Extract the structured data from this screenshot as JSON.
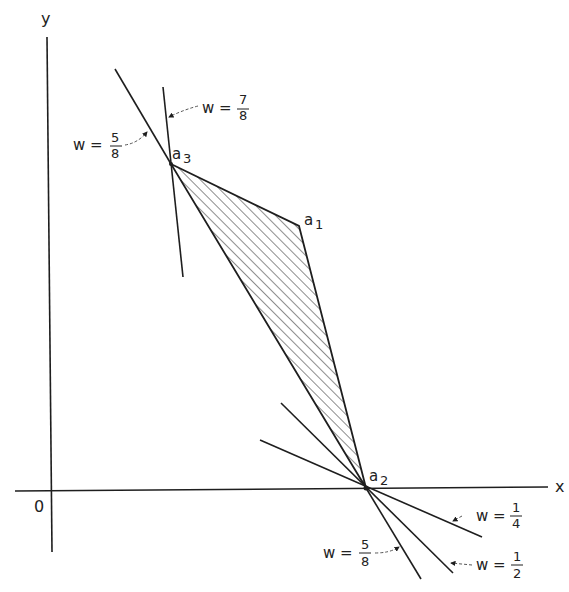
{
  "axes": {
    "x_label": "x",
    "y_label": "y",
    "origin_label": "0"
  },
  "points": {
    "a1": {
      "label": "a",
      "sub": "1"
    },
    "a2": {
      "label": "a",
      "sub": "2"
    },
    "a3": {
      "label": "a",
      "sub": "3"
    }
  },
  "lines": {
    "a3_w58": {
      "var": "w =",
      "num": "5",
      "den": "8"
    },
    "a3_w78": {
      "var": "w =",
      "num": "7",
      "den": "8"
    },
    "a2_w14": {
      "var": "w =",
      "num": "1",
      "den": "4"
    },
    "a2_w12": {
      "var": "w =",
      "num": "1",
      "den": "2"
    },
    "a2_w58": {
      "var": "w =",
      "num": "5",
      "den": "8"
    }
  },
  "colors": {
    "ink": "#1e1e1e",
    "background": "#ffffff"
  }
}
